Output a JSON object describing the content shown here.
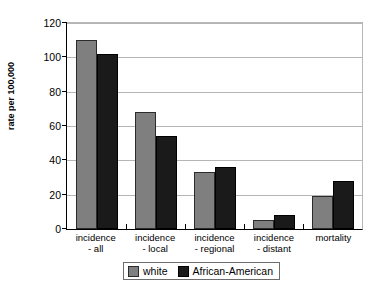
{
  "chart_data": {
    "type": "bar",
    "title": "",
    "xlabel": "",
    "ylabel": "rate per 100,000",
    "ylim": [
      0,
      120
    ],
    "yticks": [
      0,
      20,
      40,
      60,
      80,
      100,
      120
    ],
    "grid": true,
    "legend_position": "bottom",
    "categories": [
      "incidence\n- all",
      "incidence\n- local",
      "incidence\n- regional",
      "incidence\n- distant",
      "mortality"
    ],
    "series": [
      {
        "name": "white",
        "color": "#7f7f7f",
        "values": [
          110,
          68,
          33,
          5,
          19
        ]
      },
      {
        "name": "African-American",
        "color": "#1a1a1a",
        "values": [
          102,
          54,
          36,
          8,
          28
        ]
      }
    ]
  },
  "legend": {
    "items": [
      {
        "label": "white"
      },
      {
        "label": "African-American"
      }
    ]
  }
}
